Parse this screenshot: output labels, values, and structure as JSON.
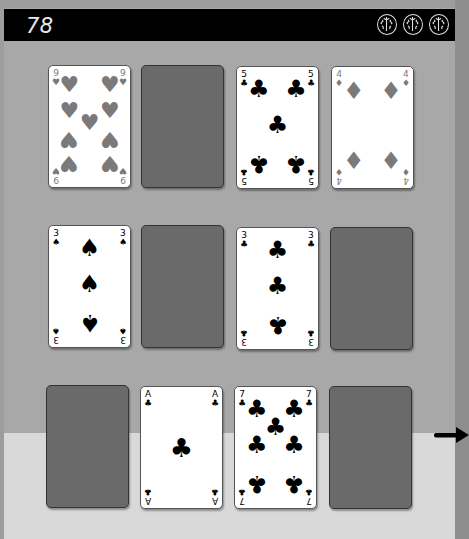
{
  "header": {
    "score": "78",
    "lives": [
      {
        "icon": "brain-icon"
      },
      {
        "icon": "brain-icon"
      },
      {
        "icon": "brain-icon"
      }
    ]
  },
  "cards": [
    {
      "row": 0,
      "col": 0,
      "face_up": true,
      "rank": "9",
      "suit": "hearts",
      "suit_glyph": "♥",
      "color": "red"
    },
    {
      "row": 0,
      "col": 1,
      "face_up": false
    },
    {
      "row": 0,
      "col": 2,
      "face_up": true,
      "rank": "5",
      "suit": "clubs",
      "suit_glyph": "♣",
      "color": "black"
    },
    {
      "row": 0,
      "col": 3,
      "face_up": true,
      "rank": "4",
      "suit": "diamonds",
      "suit_glyph": "♦",
      "color": "red"
    },
    {
      "row": 1,
      "col": 0,
      "face_up": true,
      "rank": "3",
      "suit": "spades",
      "suit_glyph": "♠",
      "color": "black"
    },
    {
      "row": 1,
      "col": 1,
      "face_up": false
    },
    {
      "row": 1,
      "col": 2,
      "face_up": true,
      "rank": "3",
      "suit": "clubs",
      "suit_glyph": "♣",
      "color": "black"
    },
    {
      "row": 1,
      "col": 3,
      "face_up": false
    },
    {
      "row": 2,
      "col": 0,
      "face_up": false
    },
    {
      "row": 2,
      "col": 1,
      "face_up": true,
      "rank": "A",
      "suit": "clubs",
      "suit_glyph": "♣",
      "color": "black"
    },
    {
      "row": 2,
      "col": 2,
      "face_up": true,
      "rank": "7",
      "suit": "clubs",
      "suit_glyph": "♣",
      "color": "black"
    },
    {
      "row": 2,
      "col": 3,
      "face_up": false
    }
  ],
  "navigation": {
    "next_icon": "arrow-right-icon"
  },
  "colors": {
    "header_bg": "#000000",
    "board_bg": "#a8a8a8",
    "board_lower_bg": "#d9d9d9",
    "card_back": "#6a6a6a",
    "red_suit": "#7a7a7a",
    "black_suit": "#000000"
  }
}
